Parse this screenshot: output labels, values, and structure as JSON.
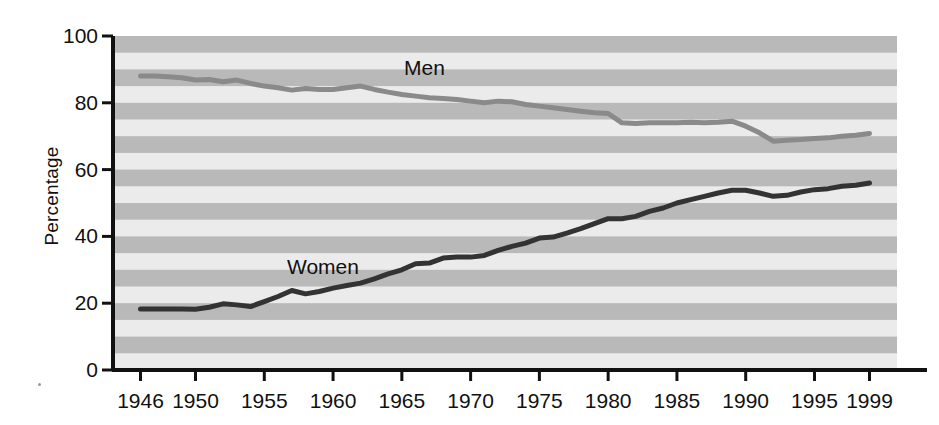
{
  "chart_data": {
    "type": "line",
    "title": "",
    "xlabel": "",
    "ylabel": "Percentage",
    "xlim": [
      1944,
      2001
    ],
    "ylim": [
      0,
      100
    ],
    "grid": "horizontal alternating shaded bands (every 5 percentage points)",
    "legend_position": "inline series labels",
    "x_tick_labels": [
      "1946",
      "1950",
      "1955",
      "1960",
      "1965",
      "1970",
      "1975",
      "1980",
      "1985",
      "1990",
      "1995",
      "1999"
    ],
    "x_tick_values": [
      1946,
      1950,
      1955,
      1960,
      1965,
      1970,
      1975,
      1980,
      1985,
      1990,
      1995,
      1999
    ],
    "y_tick_labels": [
      "0",
      "20",
      "40",
      "60",
      "80",
      "100"
    ],
    "y_tick_values": [
      0,
      20,
      40,
      60,
      80,
      100
    ],
    "x": [
      1946,
      1947,
      1948,
      1949,
      1950,
      1951,
      1952,
      1953,
      1954,
      1955,
      1956,
      1957,
      1958,
      1959,
      1960,
      1961,
      1962,
      1963,
      1964,
      1965,
      1966,
      1967,
      1968,
      1969,
      1970,
      1971,
      1972,
      1973,
      1974,
      1975,
      1976,
      1977,
      1978,
      1979,
      1980,
      1981,
      1982,
      1983,
      1984,
      1985,
      1986,
      1987,
      1988,
      1989,
      1990,
      1991,
      1992,
      1993,
      1994,
      1995,
      1996,
      1997,
      1998,
      1999
    ],
    "series": [
      {
        "name": "Men",
        "color": "#8a8a8a",
        "label_text": "Men",
        "values": [
          88.0,
          88.0,
          87.8,
          87.5,
          86.8,
          87.0,
          86.3,
          86.8,
          85.8,
          85.0,
          84.5,
          83.8,
          84.3,
          84.0,
          84.0,
          84.5,
          85.0,
          84.0,
          83.2,
          82.5,
          82.0,
          81.5,
          81.3,
          81.0,
          80.5,
          80.0,
          80.5,
          80.3,
          79.5,
          79.0,
          78.5,
          78.0,
          77.5,
          77.0,
          76.8,
          74.0,
          73.8,
          74.0,
          74.0,
          74.0,
          74.2,
          74.0,
          74.2,
          74.5,
          73.0,
          71.0,
          68.5,
          68.8,
          69.0,
          69.3,
          69.5,
          70.0,
          70.3,
          70.8
        ]
      },
      {
        "name": "Women",
        "color": "#333333",
        "label_text": "Women",
        "values": [
          18.3,
          18.3,
          18.3,
          18.3,
          18.2,
          18.8,
          19.8,
          19.5,
          19.0,
          20.5,
          22.0,
          23.8,
          22.8,
          23.5,
          24.5,
          25.3,
          26.0,
          27.3,
          28.8,
          30.0,
          31.8,
          32.0,
          33.5,
          33.8,
          33.8,
          34.3,
          35.8,
          37.0,
          38.0,
          39.5,
          39.8,
          41.0,
          42.3,
          43.8,
          45.3,
          45.3,
          46.0,
          47.5,
          48.5,
          50.0,
          51.0,
          52.0,
          53.0,
          53.8,
          53.8,
          53.0,
          52.0,
          52.3,
          53.3,
          54.0,
          54.3,
          55.0,
          55.3,
          56.0
        ]
      }
    ]
  },
  "labels": {
    "y_axis_title": "Percentage",
    "men_label": "Men",
    "women_label": "Women"
  }
}
